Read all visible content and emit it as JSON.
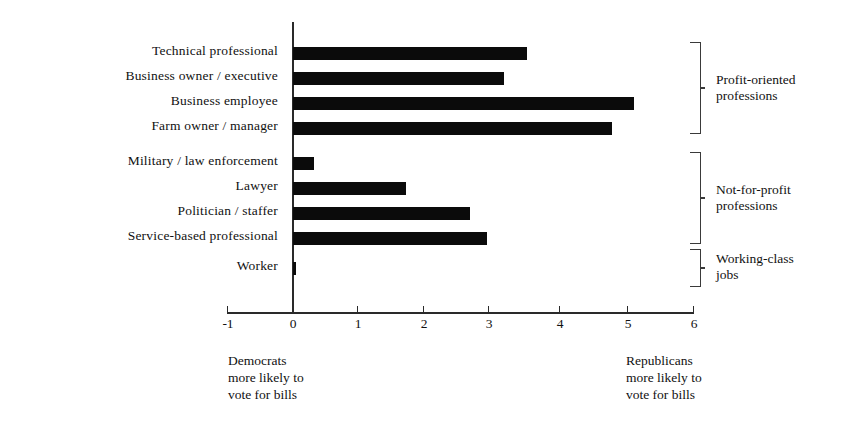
{
  "chart_data": {
    "type": "bar",
    "orientation": "horizontal",
    "title": "",
    "subtitle": "",
    "xlabel": "",
    "ylabel": "",
    "xlim": [
      -1,
      6
    ],
    "xticks": [
      -1,
      0,
      1,
      2,
      3,
      4,
      5,
      6
    ],
    "xtick_labels": [
      "-1",
      "0",
      "1",
      "2",
      "3",
      "4",
      "5",
      "6"
    ],
    "grid": false,
    "legend": null,
    "bar_color": "#0b0b0b",
    "axis_color": "#2a2a2a",
    "categories": [
      "Technical professional",
      "Business owner / executive",
      "Business employee",
      "Farm owner / manager",
      "Military / law enforcement",
      "Lawyer",
      "Politician / staffer",
      "Service-based professional",
      "Worker"
    ],
    "values": [
      3.6,
      3.25,
      5.25,
      4.9,
      0.32,
      1.74,
      2.72,
      2.98,
      0.03
    ],
    "annotations": [
      {
        "label": "Profit-oriented\nprofessions",
        "line1": "Profit-oriented",
        "line2": "professions",
        "members": [
          "Technical professional",
          "Business owner / executive",
          "Business employee",
          "Farm owner / manager"
        ]
      },
      {
        "label": "Not-for-profit\nprofessions",
        "line1": "Not-for-profit",
        "line2": "professions",
        "members": [
          "Military / law enforcement",
          "Lawyer",
          "Politician / staffer",
          "Service-based professional"
        ]
      },
      {
        "label": "Working-class\njobs",
        "line1": "Working-class",
        "line2": "jobs",
        "members": [
          "Worker"
        ]
      }
    ],
    "axis_captions": {
      "left": [
        "Democrats",
        "more likely to",
        "vote for bills"
      ],
      "right": [
        "Republicans",
        "more likely to",
        "vote for bills"
      ]
    }
  },
  "labels": {
    "cat0": "Technical professional",
    "cat1": "Business owner / executive",
    "cat2": "Business employee",
    "cat3": "Farm owner / manager",
    "cat4": "Military / law enforcement",
    "cat5": "Lawyer",
    "cat6": "Politician / staffer",
    "cat7": "Service-based professional",
    "cat8": "Worker"
  },
  "ticks": {
    "t0": "-1",
    "t1": "0",
    "t2": "1",
    "t3": "2",
    "t4": "3",
    "t5": "4",
    "t6": "5",
    "t7": "6"
  },
  "brackets": {
    "profit_line1": "Profit-oriented",
    "profit_line2": "professions",
    "nonprofit_line1": "Not-for-profit",
    "nonprofit_line2": "professions",
    "working_line1": "Working-class",
    "working_line2": "jobs"
  },
  "captions": {
    "left_line1": "Democrats",
    "left_line2": "more likely to",
    "left_line3": "vote for bills",
    "right_line1": "Republicans",
    "right_line2": "more likely to",
    "right_line3": "vote for bills"
  }
}
